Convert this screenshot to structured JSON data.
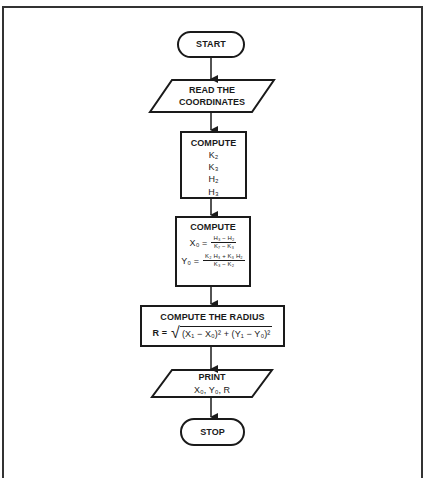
{
  "flowchart": {
    "nodes": [
      {
        "id": "start",
        "type": "terminator",
        "label": "START"
      },
      {
        "id": "read",
        "type": "input-output",
        "lines": [
          "READ THE",
          "COORDINATES"
        ]
      },
      {
        "id": "compute1",
        "type": "process",
        "title": "COMPUTE",
        "items": [
          "K₂",
          "K₃",
          "H₂",
          "H₃"
        ]
      },
      {
        "id": "compute2",
        "type": "process",
        "title": "COMPUTE",
        "x0": {
          "lhs": "X₀ =",
          "num": "H₃ − H₂",
          "den": "K₇ − K₃"
        },
        "y0": {
          "lhs": "Y₀ =",
          "num": "K₂ H₃ + K₃ H₂",
          "den": "K₃ − K₂"
        }
      },
      {
        "id": "radius",
        "type": "process",
        "title": "COMPUTE THE RADIUS",
        "lhs": "R =",
        "radicand": "(X₁ − X₀)² + (Y₁ − Y₀)²"
      },
      {
        "id": "print",
        "type": "input-output",
        "lines": [
          "PRINT",
          "X₀, Y₀, R"
        ]
      },
      {
        "id": "stop",
        "type": "terminator",
        "label": "STOP"
      }
    ],
    "edges": [
      [
        "start",
        "read"
      ],
      [
        "read",
        "compute1"
      ],
      [
        "compute1",
        "compute2"
      ],
      [
        "compute2",
        "radius"
      ],
      [
        "radius",
        "print"
      ],
      [
        "print",
        "stop"
      ]
    ]
  }
}
